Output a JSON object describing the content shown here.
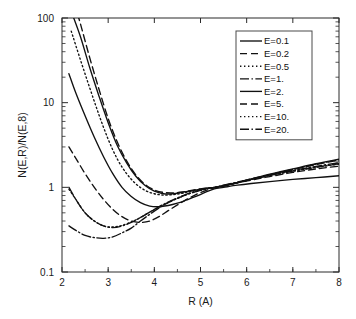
{
  "chart_data": {
    "type": "line",
    "title": "",
    "xlabel": "R (A)",
    "ylabel": "N(E,R)/N(E,8)",
    "xscale": "linear",
    "yscale": "log",
    "xlim": [
      2,
      8
    ],
    "ylim": [
      0.1,
      100
    ],
    "xticks": [
      "2",
      "3",
      "4",
      "5",
      "6",
      "7",
      "8"
    ],
    "xtick_values": [
      2,
      3,
      4,
      5,
      6,
      7,
      8
    ],
    "yticks": [
      "0.1",
      "1",
      "10",
      "100"
    ],
    "ytick_values": [
      0.1,
      1,
      10,
      100
    ],
    "grid": false,
    "legend_position": "upper right",
    "series": [
      {
        "name": "E=0.1",
        "style": "solid",
        "dash": "none",
        "x": [
          2.15,
          2.3,
          2.5,
          2.7,
          2.9,
          3.1,
          3.3,
          3.5,
          3.7,
          3.9,
          4.1,
          4.3,
          4.5,
          4.7,
          4.9,
          5.1,
          5.3,
          5.5,
          5.8,
          6.1,
          6.5,
          7.0,
          7.5,
          8.0
        ],
        "y": [
          22.0,
          13.0,
          7.0,
          3.9,
          2.3,
          1.45,
          1.0,
          0.78,
          0.66,
          0.6,
          0.59,
          0.61,
          0.65,
          0.71,
          0.78,
          0.87,
          0.96,
          1.0,
          1.06,
          1.11,
          1.17,
          1.24,
          1.3,
          1.37
        ]
      },
      {
        "name": "E=0.2",
        "style": "dashed",
        "dash": "7,4",
        "x": [
          2.15,
          2.3,
          2.5,
          2.7,
          2.9,
          3.1,
          3.3,
          3.5,
          3.7,
          3.9,
          4.1,
          4.3,
          4.5,
          4.7,
          4.9,
          5.1,
          5.3,
          5.5,
          5.8,
          6.1,
          6.5,
          7.0,
          7.5,
          8.0
        ],
        "y": [
          3.0,
          2.2,
          1.45,
          1.0,
          0.72,
          0.55,
          0.45,
          0.4,
          0.385,
          0.4,
          0.45,
          0.53,
          0.62,
          0.72,
          0.82,
          0.91,
          0.99,
          1.04,
          1.13,
          1.22,
          1.34,
          1.5,
          1.65,
          1.78
        ]
      },
      {
        "name": "E=0.5",
        "style": "dotted",
        "dash": "1.4,2.6",
        "x": [
          2.15,
          2.3,
          2.5,
          2.7,
          2.9,
          3.1,
          3.3,
          3.5,
          3.7,
          3.9,
          4.1,
          4.3,
          4.5,
          4.7,
          4.9,
          5.1,
          5.3,
          5.5,
          5.8,
          6.1,
          6.5,
          7.0,
          7.5,
          8.0
        ],
        "y": [
          0.95,
          0.72,
          0.5,
          0.4,
          0.35,
          0.34,
          0.355,
          0.39,
          0.44,
          0.51,
          0.58,
          0.66,
          0.74,
          0.82,
          0.89,
          0.95,
          1.0,
          1.05,
          1.14,
          1.24,
          1.38,
          1.55,
          1.72,
          1.88
        ]
      },
      {
        "name": "E=1.",
        "style": "dashdot",
        "dash": "9,2.5,1.4,2.5",
        "x": [
          2.15,
          2.3,
          2.5,
          2.7,
          2.9,
          3.1,
          3.3,
          3.5,
          3.7,
          3.9,
          4.1,
          4.3,
          4.5,
          4.7,
          4.9,
          5.1,
          5.3,
          5.5,
          5.8,
          6.1,
          6.5,
          7.0,
          7.5,
          8.0
        ],
        "y": [
          0.35,
          0.31,
          0.27,
          0.255,
          0.25,
          0.26,
          0.29,
          0.33,
          0.4,
          0.48,
          0.57,
          0.66,
          0.74,
          0.82,
          0.89,
          0.95,
          1.0,
          1.06,
          1.15,
          1.26,
          1.4,
          1.58,
          1.77,
          1.95
        ]
      },
      {
        "name": "E=2.",
        "style": "solid",
        "dash": "none",
        "x": [
          2.2,
          2.4,
          2.6,
          2.8,
          3.0,
          3.2,
          3.4,
          3.6,
          3.8,
          4.0,
          4.2,
          4.4,
          4.6,
          4.8,
          5.0,
          5.2,
          5.35,
          5.6,
          5.9,
          6.2,
          6.6,
          7.0,
          7.5,
          8.0
        ],
        "y": [
          120,
          60,
          26,
          12,
          5.8,
          3.1,
          1.95,
          1.35,
          1.05,
          0.9,
          0.84,
          0.84,
          0.87,
          0.91,
          0.95,
          0.99,
          1.0,
          1.07,
          1.17,
          1.3,
          1.47,
          1.65,
          1.9,
          2.15
        ]
      },
      {
        "name": "E=5.",
        "style": "dashed",
        "dash": "7,4",
        "x": [
          2.2,
          2.4,
          2.6,
          2.8,
          3.0,
          3.2,
          3.4,
          3.6,
          3.8,
          4.0,
          4.2,
          4.4,
          4.6,
          4.8,
          5.0,
          5.2,
          5.35,
          5.6,
          5.9,
          6.2,
          6.6,
          7.0,
          7.5,
          8.0
        ],
        "y": [
          200,
          85,
          34,
          14.5,
          6.5,
          3.4,
          2.05,
          1.4,
          1.08,
          0.93,
          0.87,
          0.86,
          0.88,
          0.92,
          0.96,
          0.99,
          1.0,
          1.07,
          1.17,
          1.29,
          1.45,
          1.62,
          1.86,
          2.1
        ]
      },
      {
        "name": "E=10.",
        "style": "dotted",
        "dash": "1.4,2.6",
        "x": [
          2.2,
          2.4,
          2.6,
          2.8,
          3.0,
          3.2,
          3.4,
          3.6,
          3.8,
          4.0,
          4.2,
          4.4,
          4.6,
          4.8,
          5.0,
          5.2,
          5.35,
          5.6,
          5.9,
          6.2,
          6.6,
          7.0,
          7.5,
          8.0
        ],
        "y": [
          70,
          32,
          15,
          7.2,
          3.7,
          2.15,
          1.45,
          1.1,
          0.92,
          0.84,
          0.81,
          0.82,
          0.85,
          0.9,
          0.94,
          0.98,
          1.0,
          1.07,
          1.17,
          1.29,
          1.45,
          1.63,
          1.88,
          2.12
        ]
      },
      {
        "name": "E=20.",
        "style": "dashdot",
        "dash": "9,2.5,1.4,2.5",
        "x": [
          2.15,
          2.3,
          2.5,
          2.7,
          2.9,
          3.1,
          3.3,
          3.5,
          3.7,
          3.9,
          4.1,
          4.3,
          4.5,
          4.7,
          4.9,
          5.1,
          5.3,
          5.5,
          5.8,
          6.1,
          6.5,
          7.0,
          7.5,
          8.0
        ],
        "y": [
          1.0,
          0.72,
          0.5,
          0.4,
          0.35,
          0.335,
          0.35,
          0.385,
          0.44,
          0.51,
          0.59,
          0.67,
          0.75,
          0.83,
          0.9,
          0.96,
          1.0,
          1.05,
          1.14,
          1.24,
          1.38,
          1.56,
          1.73,
          1.9
        ]
      }
    ],
    "legend_entries": [
      "E=0.1",
      "E=0.2",
      "E=0.5",
      "E=1.",
      "E=2.",
      "E=5.",
      "E=10.",
      "E=20."
    ],
    "colors": {
      "line": "#111111",
      "axis": "#2b2b2b",
      "background": "#ffffff"
    }
  }
}
